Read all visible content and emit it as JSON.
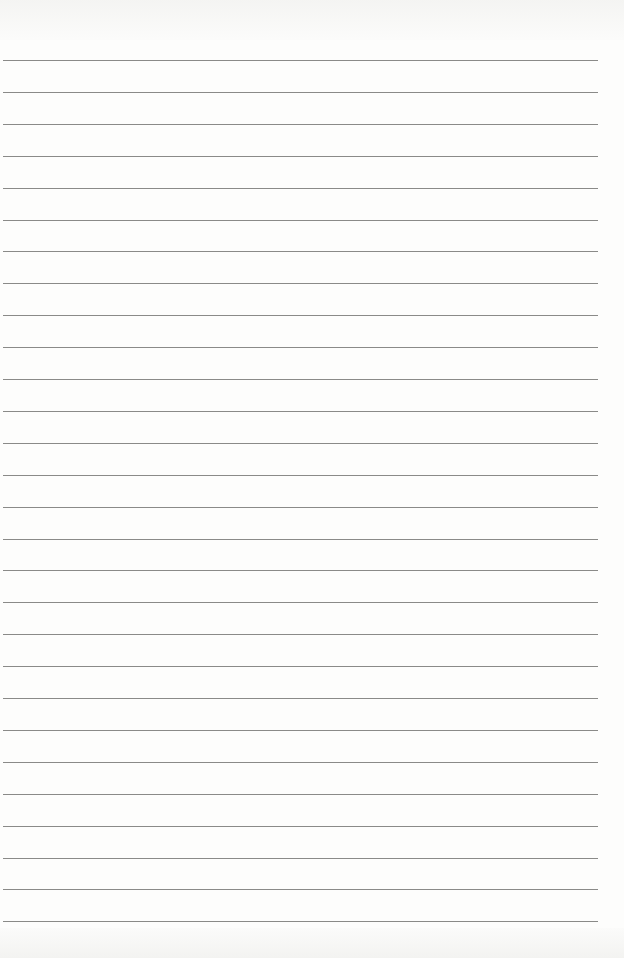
{
  "page": {
    "type": "lined-paper",
    "line_count": 28,
    "first_line_y": 60,
    "line_spacing": 31.9,
    "line_color": "#8a8a88",
    "background": "#fdfdfc"
  }
}
